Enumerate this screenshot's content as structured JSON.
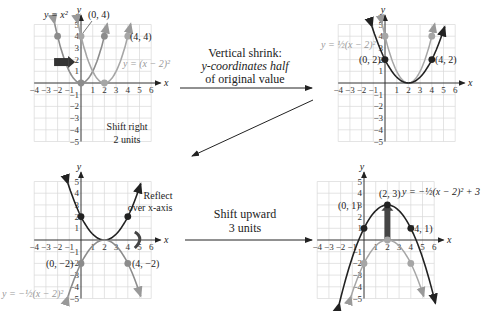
{
  "colors": {
    "dark": "#222222",
    "gray": "#8c8c8c",
    "lightgray": "#a6a6a6",
    "grid": "#d9d9d9"
  },
  "panels": [
    {
      "id": "p1",
      "label_eq1": "y = x²",
      "label_eq2": "y = (x − 2)²",
      "points": [
        "(0, 4)",
        "(4, 4)"
      ],
      "caption1": "Shift right",
      "caption2": "2 units"
    },
    {
      "id": "p2",
      "label_eq": "y = ½(x − 2)²",
      "points": [
        "(0, 2)",
        "(4, 2)"
      ]
    },
    {
      "id": "p3",
      "label_eq": "y = −½(x − 2)²",
      "points": [
        "(0, −2)",
        "(4, −2)"
      ],
      "caption1": "Reflect",
      "caption2": "over x-axis"
    },
    {
      "id": "p4",
      "label_eq": "y = −½(x − 2)² + 3",
      "points": [
        "(2, 3)",
        "(0, 1)",
        "(4, 1)"
      ]
    }
  ],
  "arrows": [
    {
      "label1": "Vertical shrink:",
      "label2": "y-coordinates half",
      "label3": "of original value"
    },
    {
      "label1": "Shift upward",
      "label2": "3 units"
    }
  ],
  "axis": {
    "xticks": [
      "−4",
      "−3",
      "−2",
      "−1",
      "1",
      "2",
      "3",
      "4",
      "5",
      "6"
    ],
    "yticks": [
      "5",
      "4",
      "3",
      "2",
      "1",
      "−1",
      "−2",
      "−3",
      "−4",
      "−5"
    ],
    "xlabel": "x",
    "ylabel": "y"
  }
}
